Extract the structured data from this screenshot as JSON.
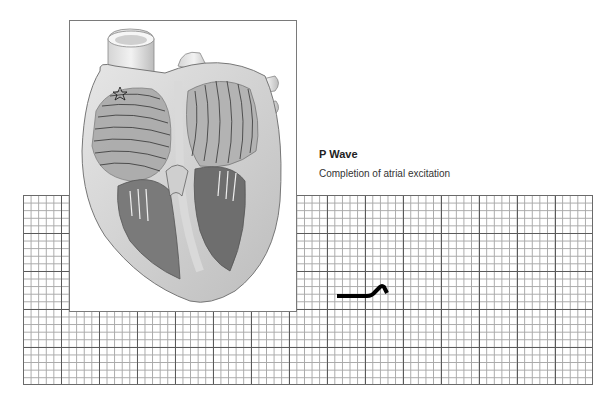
{
  "caption": {
    "title": "P Wave",
    "subtitle": "Completion of atrial excitation"
  },
  "figure": {
    "heart_illustration": "cross-section-of-heart-with-atrial-depolarization-wavefront-lines",
    "sa_node_marker": "star-icon",
    "ecg_grid": {
      "small_cell_px": 7.6,
      "major_every_cells": 5,
      "columns": 75,
      "rows": 25
    },
    "trace_segment": "baseline-then-p-wave-upstroke"
  },
  "colors": {
    "grid_major": "#5a5a5a",
    "grid_minor": "#a8a8a8",
    "trace": "#000000",
    "text": "#222222"
  }
}
